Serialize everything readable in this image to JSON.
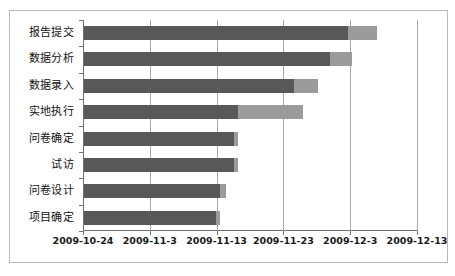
{
  "chart_data": {
    "type": "bar",
    "subtype": "stacked-horizontal-gantt",
    "title": "",
    "xlabel": "",
    "ylabel": "",
    "grid": true,
    "legend": "none",
    "orientation": "horizontal",
    "categories": [
      "项目确定",
      "问卷设计",
      "试访",
      "问卷确定",
      "实地执行",
      "数据录入",
      "数据分析",
      "报告提交"
    ],
    "categories_top_to_bottom": [
      "报告提交",
      "数据分析",
      "数据录入",
      "实地执行",
      "问卷确定",
      "试访",
      "问卷设计",
      "项目确定"
    ],
    "xlim": [
      "2009-10-24",
      "2009-12-13"
    ],
    "xticks": [
      "2009-10-24",
      "2009-11-3",
      "2009-11-13",
      "2009-11-23",
      "2009-12-3",
      "2009-12-13"
    ],
    "xtick_day_offsets": [
      0,
      10,
      20,
      30,
      40,
      50
    ],
    "series": [
      {
        "name": "offset",
        "color": "#585858",
        "values_days": [
          19.8,
          20.4,
          22.5,
          22.5,
          23.0,
          31.4,
          36.8,
          39.5
        ]
      },
      {
        "name": "duration",
        "color": "#9b9b9b",
        "values_days": [
          0.6,
          0.9,
          0.6,
          0.6,
          9.8,
          3.6,
          3.3,
          4.3
        ]
      }
    ],
    "bars": [
      {
        "category": "报告提交",
        "offset_days": 39.5,
        "duration_days": 4.3,
        "start": "2009-12-2",
        "end": "2009-12-6"
      },
      {
        "category": "数据分析",
        "offset_days": 36.8,
        "duration_days": 3.3,
        "start": "2009-11-29",
        "end": "2009-12-3"
      },
      {
        "category": "数据录入",
        "offset_days": 31.4,
        "duration_days": 3.6,
        "start": "2009-11-24",
        "end": "2009-11-28"
      },
      {
        "category": "实地执行",
        "offset_days": 23.0,
        "duration_days": 9.8,
        "start": "2009-11-16",
        "end": "2009-11-26"
      },
      {
        "category": "问卷确定",
        "offset_days": 22.5,
        "duration_days": 0.6,
        "start": "2009-11-15",
        "end": "2009-11-16"
      },
      {
        "category": "试访",
        "offset_days": 22.5,
        "duration_days": 0.6,
        "start": "2009-11-15",
        "end": "2009-11-16"
      },
      {
        "category": "问卷设计",
        "offset_days": 20.4,
        "duration_days": 0.9,
        "start": "2009-11-13",
        "end": "2009-11-14"
      },
      {
        "category": "项目确定",
        "offset_days": 19.8,
        "duration_days": 0.6,
        "start": "2009-11-12",
        "end": "2009-11-13"
      }
    ]
  },
  "colors": {
    "offset_bar": "#585858",
    "duration_bar": "#9b9b9b",
    "gridline": "#a8a8a8",
    "axis": "#6f6f6f",
    "frame_border": "#b9b9b9",
    "text": "#111111",
    "background": "#ffffff"
  }
}
